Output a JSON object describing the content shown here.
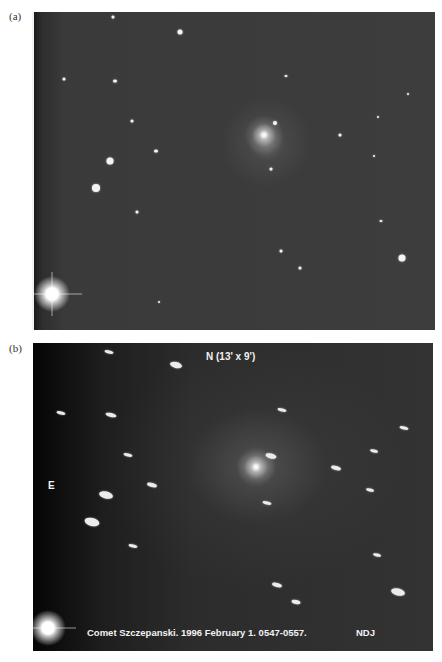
{
  "figure": {
    "panel_a": {
      "label": "(a)"
    },
    "panel_b": {
      "label": "(b)",
      "orientation_north": "N (13' x 9')",
      "orientation_east": "E",
      "caption_overlay": "Comet Szczepanski.  1996 February 1. 0547-0557.",
      "credit": "NDJ"
    }
  }
}
